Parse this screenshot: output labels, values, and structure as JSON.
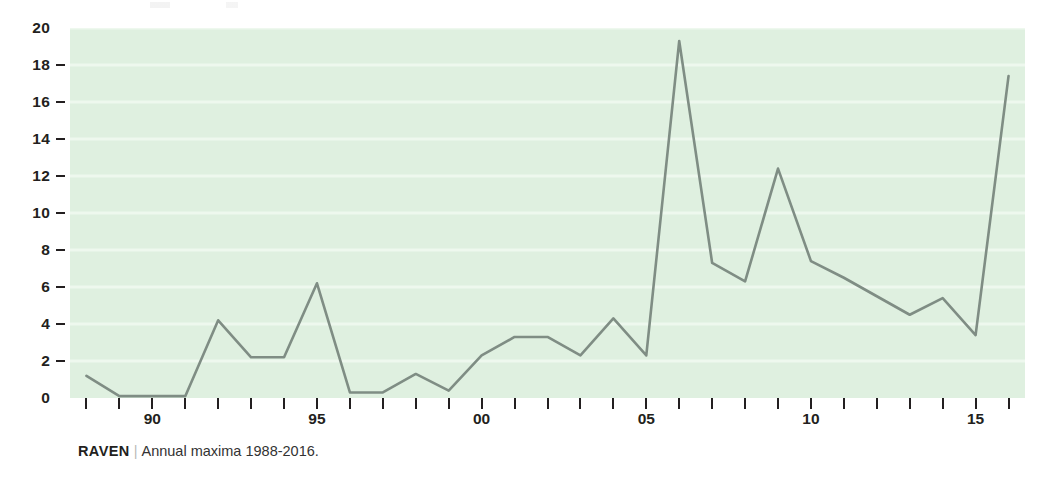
{
  "caption": {
    "source": "RAVEN",
    "separator": "|",
    "text": "Annual maxima 1988-2016."
  },
  "chart_data": {
    "type": "line",
    "title": "",
    "subtitle": "",
    "xlabel": "",
    "ylabel": "",
    "x": [
      1988,
      1989,
      1990,
      1991,
      1992,
      1993,
      1994,
      1995,
      1996,
      1997,
      1998,
      1999,
      2000,
      2001,
      2002,
      2003,
      2004,
      2005,
      2006,
      2007,
      2008,
      2009,
      2010,
      2011,
      2012,
      2013,
      2014,
      2015,
      2016
    ],
    "values": [
      1.2,
      0.1,
      0.1,
      0.1,
      4.2,
      2.2,
      2.2,
      6.2,
      0.3,
      0.3,
      1.3,
      0.4,
      2.3,
      3.3,
      3.3,
      2.3,
      4.3,
      2.3,
      19.3,
      7.3,
      6.3,
      12.4,
      7.4,
      6.5,
      5.5,
      4.5,
      5.4,
      3.4,
      17.4
    ],
    "series": [
      {
        "name": "Annual maxima",
        "values": [
          1.2,
          0.1,
          0.1,
          0.1,
          4.2,
          2.2,
          2.2,
          6.2,
          0.3,
          0.3,
          1.3,
          0.4,
          2.3,
          3.3,
          3.3,
          2.3,
          4.3,
          2.3,
          19.3,
          7.3,
          6.3,
          12.4,
          7.4,
          6.5,
          5.5,
          4.5,
          5.4,
          3.4,
          17.4
        ],
        "color": "#7f8d84"
      }
    ],
    "xlim": [
      1987.5,
      2016.5
    ],
    "ylim": [
      0,
      20
    ],
    "yticks": [
      0,
      2,
      4,
      6,
      8,
      10,
      12,
      14,
      16,
      18,
      20
    ],
    "ytick_labels": [
      "0",
      "2",
      "4",
      "6",
      "8",
      "10",
      "12",
      "14",
      "16",
      "18",
      "20"
    ],
    "xticks": [
      1988,
      1989,
      1990,
      1991,
      1992,
      1993,
      1994,
      1995,
      1996,
      1997,
      1998,
      1999,
      2000,
      2001,
      2002,
      2003,
      2004,
      2005,
      2006,
      2007,
      2008,
      2009,
      2010,
      2011,
      2012,
      2013,
      2014,
      2015,
      2016
    ],
    "xtick_labels": {
      "1990": "90",
      "1995": "95",
      "2000": "00",
      "2005": "05",
      "2010": "10",
      "2015": "15"
    },
    "grid": true,
    "grid_axis": "y",
    "legend": "none",
    "plot_background": "#dff0e0",
    "grid_color": "#eef8ee",
    "line_color": "#7f8d84",
    "line_width": 2.6,
    "tick_color": "#231f20"
  }
}
